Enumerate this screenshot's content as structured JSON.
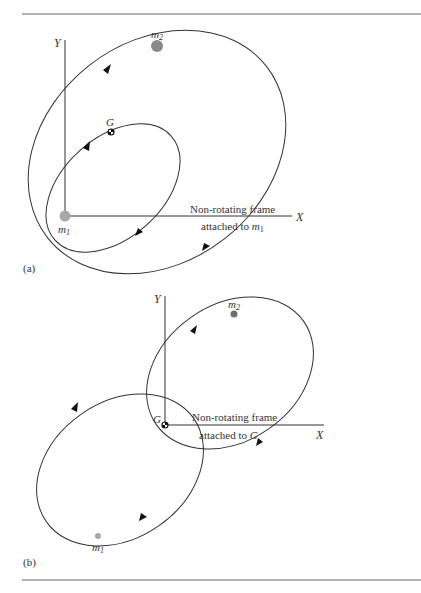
{
  "figure": {
    "panel_a": {
      "tag": "(a)",
      "axis_x": "X",
      "axis_y": "Y",
      "mass1": {
        "name": "m",
        "sub": "1"
      },
      "mass2": {
        "name": "m",
        "sub": "2"
      },
      "center_of_mass": "G",
      "frame_label_line1": "Non-rotating frame",
      "frame_label_line2_prefix": "attached to ",
      "frame_label_line2_sym": "m",
      "frame_label_line2_sub": "1"
    },
    "panel_b": {
      "tag": "(b)",
      "axis_x": "X",
      "axis_y": "Y",
      "mass1": {
        "name": "m",
        "sub": "1"
      },
      "mass2": {
        "name": "m",
        "sub": "2"
      },
      "center_of_mass": "G",
      "frame_label_line1": "Non-rotating frame",
      "frame_label_line2_prefix": "attached to ",
      "frame_label_line2_sym": "G"
    },
    "colors": {
      "line": "#333333",
      "mass1": "#a8a8a8",
      "mass2_a": "#8a8a8a",
      "mass2_b": "#707070",
      "rule": "#666666"
    }
  }
}
